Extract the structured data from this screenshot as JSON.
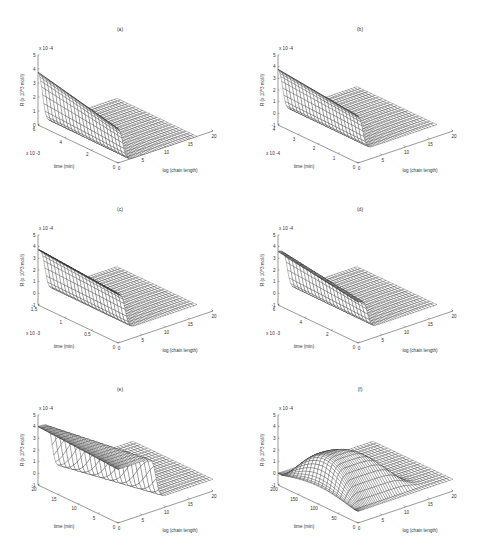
{
  "figure": {
    "panels": [
      {
        "id": "a",
        "title": "(a)",
        "left": 0,
        "top": 0
      },
      {
        "id": "b",
        "title": "(b)",
        "left": 240,
        "top": 0
      },
      {
        "id": "c",
        "title": "(c)",
        "left": 0,
        "top": 180
      },
      {
        "id": "d",
        "title": "(d)",
        "left": 240,
        "top": 180
      },
      {
        "id": "e",
        "title": "(e)",
        "left": 0,
        "top": 360
      },
      {
        "id": "f",
        "title": "(f)",
        "left": 240,
        "top": 360
      }
    ]
  },
  "chart_data": [
    {
      "panel": "a",
      "title": "(a)",
      "type": "surface3d",
      "xlabel": "log (chain length)",
      "ylabel": "time (min)",
      "zlabel": "R (x 10^3 mol/l)",
      "x_ticks": [
        "0",
        "5",
        "10",
        "15",
        "20"
      ],
      "xlim": [
        0,
        20
      ],
      "y_ticks": [
        "0",
        "2",
        "4",
        "6"
      ],
      "ylim": [
        0,
        6
      ],
      "y_multiplier": "x 10^-3",
      "z_ticks": [
        "0",
        "1",
        "2",
        "3",
        "4",
        "5"
      ],
      "zlim": [
        0,
        5
      ],
      "z_multiplier": "x 10^-4",
      "description": "Plateau at ~4 for low chain length, steep drop near log chain length ~1, flat near 0 afterwards; plateau decays over time",
      "profile": {
        "plateau": 4.0,
        "step_x": 1.0,
        "decay": 0.35,
        "floor": 0.0
      }
    },
    {
      "panel": "b",
      "title": "(b)",
      "type": "surface3d",
      "xlabel": "log (chain length)",
      "ylabel": "time (min)",
      "zlabel": "R (x 10^3 mol/l)",
      "x_ticks": [
        "0",
        "5",
        "10",
        "15",
        "20"
      ],
      "xlim": [
        0,
        20
      ],
      "y_ticks": [
        "0",
        "1",
        "2",
        "3",
        "4"
      ],
      "ylim": [
        0,
        4
      ],
      "y_multiplier": "x 10^-4",
      "z_ticks": [
        "-1",
        "0",
        "1",
        "2",
        "3",
        "4",
        "5"
      ],
      "zlim": [
        -1,
        5
      ],
      "z_multiplier": "x 10^-4",
      "description": "Plateau ~4 dropping sharply near log chain length ~1, surface floor near 0",
      "profile": {
        "plateau": 4.0,
        "step_x": 1.0,
        "decay": 0.2,
        "floor": 0.0
      }
    },
    {
      "panel": "c",
      "title": "(c)",
      "type": "surface3d",
      "xlabel": "log (chain length)",
      "ylabel": "time (min)",
      "zlabel": "R (x 10^3 mol/l)",
      "x_ticks": [
        "0",
        "5",
        "10",
        "15",
        "20"
      ],
      "xlim": [
        0,
        20
      ],
      "y_ticks": [
        "0",
        "0.5",
        "1",
        "1.5"
      ],
      "ylim": [
        0,
        1.5
      ],
      "y_multiplier": "x 10^-3",
      "z_ticks": [
        "-1",
        "0",
        "1",
        "2",
        "3",
        "4",
        "5"
      ],
      "zlim": [
        -1,
        5
      ],
      "z_multiplier": "x 10^-4",
      "description": "Plateau ~3.8 dropping sharply near log chain length ~1.5 to 0",
      "profile": {
        "plateau": 3.8,
        "step_x": 1.5,
        "decay": 0.15,
        "floor": 0.0
      }
    },
    {
      "panel": "d",
      "title": "(d)",
      "type": "surface3d",
      "xlabel": "log (chain length)",
      "ylabel": "time (min)",
      "zlabel": "R (x 10^3 mol/l)",
      "x_ticks": [
        "0",
        "5",
        "10",
        "15",
        "20"
      ],
      "xlim": [
        0,
        20
      ],
      "y_ticks": [
        "0",
        "2",
        "4",
        "6"
      ],
      "ylim": [
        0,
        6
      ],
      "y_multiplier": "x 10^-3",
      "z_ticks": [
        "-1",
        "0",
        "1",
        "2",
        "3",
        "4",
        "5"
      ],
      "zlim": [
        -1,
        5
      ],
      "z_multiplier": "x 10^-4",
      "description": "Plateau ~3.6 decreasing with time, sharp drop near log chain length ~2",
      "profile": {
        "plateau": 3.6,
        "step_x": 2.0,
        "decay": 0.3,
        "floor": 0.0
      }
    },
    {
      "panel": "e",
      "title": "(e)",
      "type": "surface3d",
      "xlabel": "log (chain length)",
      "ylabel": "time (min)",
      "zlabel": "R (x 10^3 mol/l)",
      "x_ticks": [
        "0",
        "5",
        "10",
        "15",
        "20"
      ],
      "xlim": [
        0,
        20
      ],
      "y_ticks": [
        "0",
        "5",
        "10",
        "15",
        "20"
      ],
      "ylim": [
        0,
        20
      ],
      "z_ticks": [
        "-1",
        "0",
        "1",
        "2",
        "3",
        "4",
        "5"
      ],
      "zlim": [
        -1,
        5
      ],
      "z_multiplier": "x 10^-4",
      "description": "Plateau ~4 at low chain length; step edge moves to higher chain length over time (up to ~8 at t=0)",
      "profile": {
        "plateau": 4.0,
        "step_x": 3.0,
        "step_shift": 5.0,
        "decay": 0.1,
        "floor": 0.0
      }
    },
    {
      "panel": "f",
      "title": "(f)",
      "type": "surface3d",
      "xlabel": "log (chain length)",
      "ylabel": "time (min)",
      "zlabel": "R (x 10^3 mol/l)",
      "x_ticks": [
        "0",
        "5",
        "10",
        "15",
        "20"
      ],
      "xlim": [
        0,
        20
      ],
      "y_ticks": [
        "0",
        "50",
        "100",
        "150",
        "200"
      ],
      "ylim": [
        0,
        200
      ],
      "z_ticks": [
        "-1",
        "0",
        "1",
        "2",
        "3",
        "4",
        "5"
      ],
      "zlim": [
        -1,
        5
      ],
      "z_multiplier": "x 10^-4",
      "description": "Hump-shaped surface peaking at ~3 mid-time, falling to ~0 at early and late times; distribution spreads toward longer chains",
      "profile": {
        "peak": 2.9,
        "floor": 0.0
      }
    }
  ]
}
